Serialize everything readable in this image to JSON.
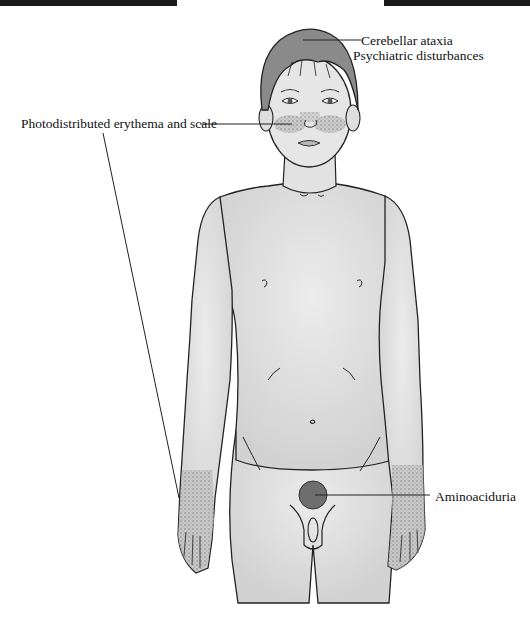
{
  "figure": {
    "annotations": [
      {
        "id": "cerebellar",
        "label": "Cerebellar ataxia",
        "target": "head"
      },
      {
        "id": "psychiatric",
        "label": "Psychiatric disturbances",
        "target": "head"
      },
      {
        "id": "photodistributed",
        "label": "Photodistributed erythema and scale",
        "target": "face and forearms"
      },
      {
        "id": "aminoaciduria",
        "label": "Aminoaciduria",
        "target": "bladder"
      }
    ]
  },
  "colors": {
    "line": "#222222",
    "skin": "#dcdcdc",
    "hair": "#8a8a8a",
    "bladder": "#6e6e6e",
    "rash": "#9a9a9a",
    "bars": "#1a1a1a"
  }
}
